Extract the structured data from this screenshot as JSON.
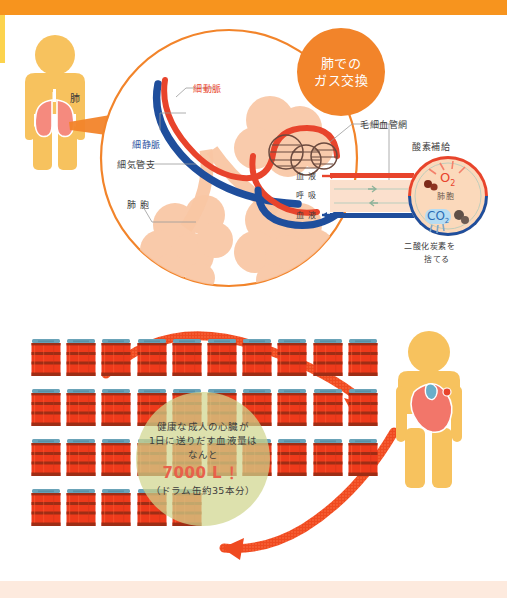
{
  "page": {
    "bar_colors": {
      "top": "#f7941e",
      "left_edge": "#fcd34d",
      "bottom": "#fdeade"
    },
    "background": "#ffffff"
  },
  "top_panel": {
    "title_badge": {
      "line1": "肺での",
      "line2": "ガス交換",
      "color": "#f2842a"
    },
    "body_label": "肺",
    "labels": [
      {
        "name": "arteriole",
        "text": "細動脈",
        "color": "#e8442c"
      },
      {
        "name": "venule",
        "text": "細静脈",
        "color": "#2b4f9e"
      },
      {
        "name": "bronchiole",
        "text": "細気管支",
        "color": "#3b3b3b"
      },
      {
        "name": "alveolus",
        "text": "肺 胞",
        "color": "#3b3b3b"
      },
      {
        "name": "capillary-network",
        "text": "毛細血管網",
        "color": "#3b3b3b"
      },
      {
        "name": "oxygen-supply",
        "text": "酸素補給",
        "color": "#3b3b3b"
      },
      {
        "name": "blood-in",
        "text": "血 液",
        "color": "#3b3b3b"
      },
      {
        "name": "respiration",
        "text": "呼 吸",
        "color": "#3b3b3b"
      },
      {
        "name": "blood-out",
        "text": "血 液",
        "color": "#3b3b3b"
      },
      {
        "name": "alveolus-detail",
        "text": "肺胞",
        "color": "#6b5a4e"
      },
      {
        "name": "co2-discard-line1",
        "text": "二酸化炭素を",
        "color": "#3b3b3b"
      },
      {
        "name": "co2-discard-line2",
        "text": "捨てる",
        "color": "#3b3b3b"
      }
    ],
    "gas_molecules": [
      {
        "name": "o2",
        "text": "O",
        "sub": "2",
        "color": "#e8442c"
      },
      {
        "name": "co2",
        "text": "CO",
        "sub": "2",
        "color": "#2b6cb5"
      }
    ],
    "diagram_colors": {
      "artery": "#e8442c",
      "vein": "#1f4e9c",
      "alveoli_fill": "#f9c6a3",
      "circle_outline": "#f2842a",
      "capillary": "#6b4a3f",
      "body": "#f7c25e"
    }
  },
  "bottom_panel": {
    "callout": {
      "line1": "健康な成人の心臓が",
      "line2": "1日に送りだす血液量は",
      "line3": "なんと",
      "big": "7000 L ！",
      "line4": "（ドラム缶約35本分）",
      "bg_color": "#d0d68d",
      "big_color": "#e8604a"
    },
    "drums": {
      "total": 35,
      "rows": [
        10,
        10,
        10,
        5
      ],
      "body_color": "#ee3a1b",
      "band_color": "#9e2d15",
      "lid_color": "#6aa3b8"
    },
    "arrows": {
      "color": "#ef4a20",
      "top_label": "",
      "bottom_label": ""
    },
    "figure": {
      "body_color": "#f7c25e",
      "heart_colors": {
        "main": "#f2766a",
        "vein": "#6aaec9",
        "aorta": "#e8442c"
      }
    }
  }
}
